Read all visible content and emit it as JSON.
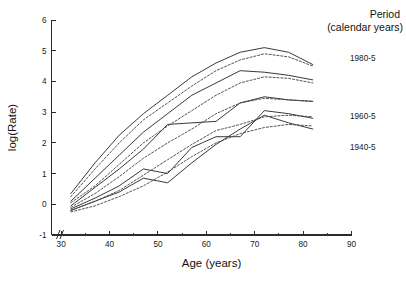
{
  "chart_data": {
    "type": "line",
    "title": "",
    "xlabel": "Age (years)",
    "ylabel": "log(Rate)",
    "xlim": [
      28,
      90
    ],
    "ylim": [
      -1,
      6
    ],
    "x_ticks": [
      30,
      40,
      50,
      60,
      70,
      80,
      90
    ],
    "x_minor_ticks": [
      35,
      45,
      55,
      65,
      75,
      85
    ],
    "y_ticks": [
      -1,
      0,
      1,
      2,
      3,
      4,
      5,
      6
    ],
    "grid": false,
    "axis_break": true,
    "axis_break_label": "//",
    "legend": {
      "position": "right",
      "title_line1": "Period",
      "title_line2": "(calendar years)",
      "entries": [
        {
          "label": "1980-5",
          "style": "mixed"
        },
        {
          "label": "1960-5",
          "style": "mixed"
        },
        {
          "label": "1940-5",
          "style": "mixed"
        }
      ]
    },
    "series": [
      {
        "name": "cohort-solid-1",
        "style": "solid",
        "x": [
          32,
          37,
          42,
          47,
          52,
          57,
          62,
          67,
          72,
          77,
          82
        ],
        "values": [
          0.35,
          1.35,
          2.25,
          2.95,
          3.55,
          4.15,
          4.6,
          4.95,
          5.1,
          4.95,
          4.55
        ]
      },
      {
        "name": "cohort-solid-2",
        "style": "solid",
        "x": [
          32,
          37,
          42,
          47,
          52,
          57,
          62,
          67,
          72,
          77,
          82
        ],
        "values": [
          0.1,
          0.85,
          1.6,
          2.35,
          2.95,
          3.55,
          3.95,
          4.35,
          4.3,
          4.2,
          4.05
        ]
      },
      {
        "name": "cohort-solid-3",
        "style": "solid",
        "x": [
          32,
          37,
          42,
          47,
          52,
          57,
          62,
          67,
          72,
          77,
          82
        ],
        "values": [
          -0.05,
          0.55,
          1.15,
          1.8,
          2.6,
          2.65,
          2.7,
          3.3,
          3.5,
          3.4,
          3.35
        ]
      },
      {
        "name": "cohort-solid-4",
        "style": "solid",
        "x": [
          32,
          37,
          42,
          47,
          52,
          57,
          62,
          67,
          72,
          77,
          82
        ],
        "values": [
          -0.15,
          0.2,
          0.6,
          1.15,
          1.0,
          1.85,
          2.2,
          2.2,
          3.05,
          2.95,
          2.8
        ]
      },
      {
        "name": "cohort-solid-5",
        "style": "solid",
        "x": [
          32,
          37,
          42,
          47,
          52,
          57,
          62,
          67,
          72,
          77,
          82
        ],
        "values": [
          -0.2,
          0.1,
          0.4,
          0.85,
          0.7,
          1.35,
          1.95,
          2.45,
          2.9,
          2.65,
          2.45
        ]
      },
      {
        "name": "cohort-dashed-1",
        "style": "dashed",
        "x": [
          32,
          37,
          42,
          47,
          52,
          57,
          62,
          67,
          72,
          77,
          82
        ],
        "values": [
          0.25,
          1.15,
          2.0,
          2.75,
          3.3,
          3.85,
          4.35,
          4.7,
          4.9,
          4.8,
          4.5
        ]
      },
      {
        "name": "cohort-dashed-2",
        "style": "dashed",
        "x": [
          32,
          37,
          42,
          47,
          52,
          57,
          62,
          67,
          72,
          77,
          82
        ],
        "values": [
          0.05,
          0.6,
          1.3,
          2.0,
          2.55,
          3.05,
          3.55,
          3.95,
          4.15,
          4.1,
          3.95
        ]
      },
      {
        "name": "cohort-dashed-3",
        "style": "dashed",
        "x": [
          32,
          37,
          42,
          47,
          52,
          57,
          62,
          67,
          72,
          77,
          82
        ],
        "values": [
          -0.1,
          0.35,
          0.9,
          1.5,
          2.0,
          2.45,
          2.95,
          3.3,
          3.45,
          3.4,
          3.35
        ]
      },
      {
        "name": "cohort-dashed-4",
        "style": "dashed",
        "x": [
          32,
          37,
          42,
          47,
          52,
          57,
          62,
          67,
          72,
          77,
          82
        ],
        "values": [
          -0.2,
          0.1,
          0.45,
          0.95,
          1.45,
          1.95,
          2.4,
          2.6,
          2.85,
          2.9,
          2.85
        ]
      },
      {
        "name": "cohort-dashed-5",
        "style": "dashed",
        "x": [
          32,
          37,
          42,
          47,
          52,
          57,
          62,
          67,
          72,
          77,
          82
        ],
        "values": [
          -0.25,
          -0.05,
          0.25,
          0.6,
          1.05,
          1.55,
          2.0,
          2.3,
          2.5,
          2.6,
          2.55
        ]
      }
    ]
  }
}
